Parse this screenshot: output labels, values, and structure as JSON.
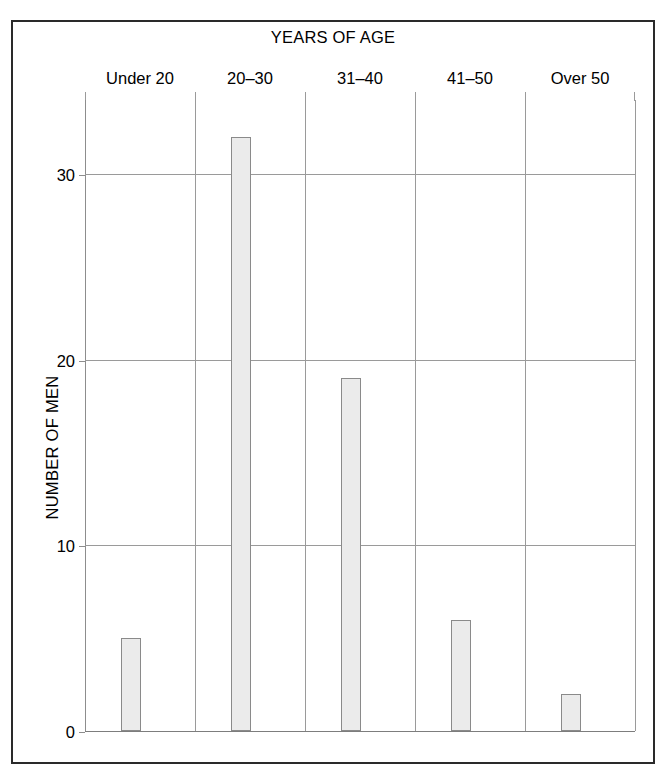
{
  "chart_data": {
    "type": "bar",
    "title": "YEARS OF AGE",
    "xlabel": "YEARS OF AGE",
    "ylabel": "NUMBER OF MEN",
    "categories": [
      "Under 20",
      "20–30",
      "31–40",
      "41–50",
      "Over 50"
    ],
    "values": [
      5,
      32,
      19,
      6,
      2
    ],
    "ylim": [
      0,
      34
    ],
    "yticks": [
      0,
      10,
      20,
      30
    ],
    "ytick_labels": [
      "0",
      "10",
      "20",
      "30"
    ],
    "grid": true,
    "legend": "none",
    "colors": {
      "bar_fill": "#ebebeb",
      "bar_border": "#8a8a8a",
      "grid": "#9a9a9a",
      "frame": "#2a2a2a",
      "text": "#000000",
      "background": "#ffffff"
    }
  },
  "axis": {
    "ytick_0": "0",
    "ytick_1": "10",
    "ytick_2": "20",
    "ytick_3": "30"
  }
}
